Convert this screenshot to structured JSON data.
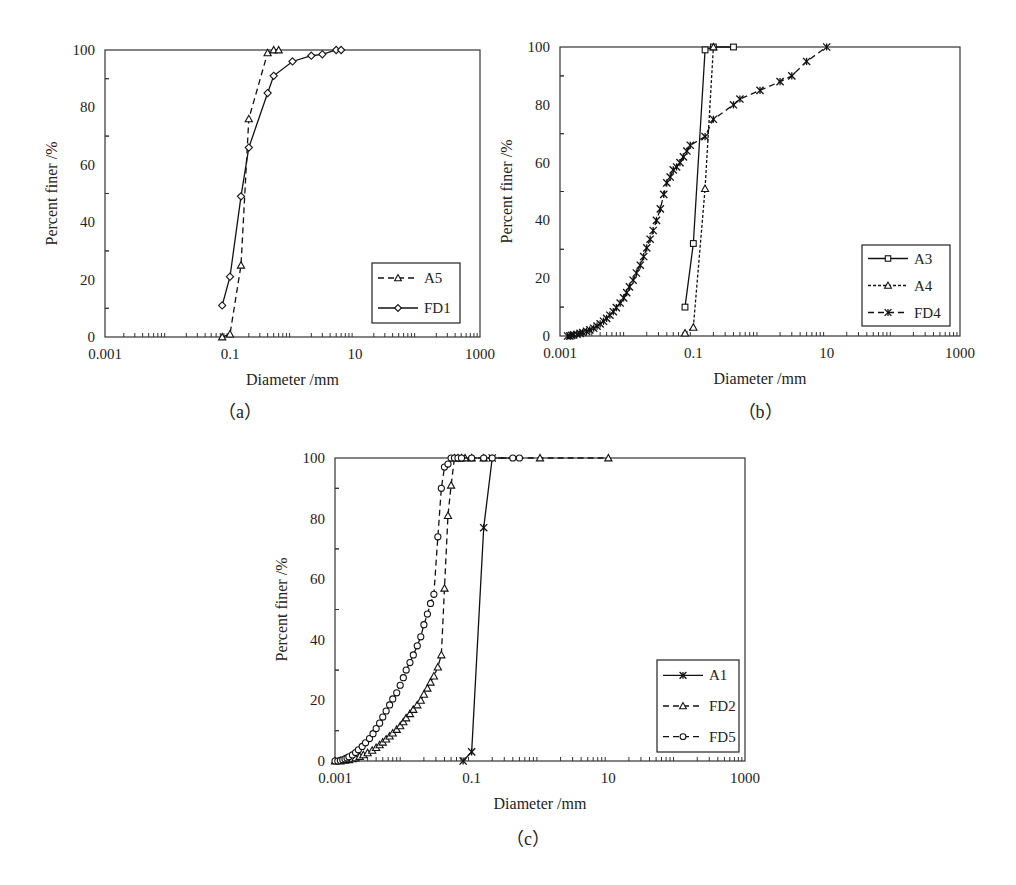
{
  "figure": {
    "panels": [
      "a",
      "b",
      "c"
    ]
  },
  "chart_data": [
    {
      "id": "a",
      "type": "line",
      "caption": "（a）",
      "xlabel": "Diameter /mm",
      "ylabel": "Percent finer /%",
      "xscale": "log",
      "xlim": [
        0.001,
        1000
      ],
      "ylim": [
        0,
        100
      ],
      "xticks": [
        "0.001",
        "0.1",
        "10",
        "1000"
      ],
      "yticks": [
        "0",
        "20",
        "40",
        "60",
        "80",
        "100"
      ],
      "legend_position": "lower right",
      "frame": {
        "left": 105,
        "top": 50,
        "right": 480,
        "bottom": 337
      },
      "legend_box": {
        "x": 372,
        "y": 263,
        "w": 88,
        "h": 60
      },
      "caption_pos": {
        "x": 240,
        "y": 418
      },
      "series": [
        {
          "name": "A5",
          "marker": "triangle",
          "line": "dashed",
          "x": [
            0.075,
            0.1,
            0.15,
            0.2,
            0.4,
            0.5,
            0.6
          ],
          "y": [
            0,
            1,
            25,
            76,
            99,
            100,
            100
          ]
        },
        {
          "name": "FD1",
          "marker": "diamond",
          "line": "solid",
          "x": [
            0.075,
            0.1,
            0.15,
            0.2,
            0.4,
            0.5,
            1,
            2,
            3,
            5,
            6
          ],
          "y": [
            11,
            21,
            49,
            66,
            85,
            91,
            96,
            98,
            98.5,
            100,
            100
          ]
        }
      ]
    },
    {
      "id": "b",
      "type": "line",
      "caption": "（b）",
      "xlabel": "Diameter  /mm",
      "ylabel": "Percent finer /%",
      "xscale": "log",
      "xlim": [
        0.001,
        1000
      ],
      "ylim": [
        0,
        100
      ],
      "xticks": [
        "0.001",
        "0.1",
        "10",
        "1000"
      ],
      "yticks": [
        "0",
        "20",
        "40",
        "60",
        "80",
        "100"
      ],
      "legend_position": "lower right",
      "frame": {
        "left": 560,
        "top": 47,
        "right": 960,
        "bottom": 336
      },
      "legend_box": {
        "x": 862,
        "y": 245,
        "w": 88,
        "h": 81
      },
      "caption_pos": {
        "x": 760,
        "y": 418
      },
      "series": [
        {
          "name": "A3",
          "marker": "square",
          "line": "solid",
          "x": [
            0.075,
            0.1,
            0.15,
            0.2,
            0.4
          ],
          "y": [
            10,
            32,
            99,
            100,
            100
          ]
        },
        {
          "name": "A4",
          "marker": "triangle",
          "line": "dotted",
          "x": [
            0.075,
            0.1,
            0.15,
            0.2
          ],
          "y": [
            1,
            3,
            51,
            100
          ]
        },
        {
          "name": "FD4",
          "marker": "asterisk",
          "line": "dashed",
          "x": [
            0.0013,
            0.0014,
            0.0015,
            0.0016,
            0.0018,
            0.002,
            0.0022,
            0.0025,
            0.0028,
            0.0032,
            0.0036,
            0.004,
            0.0045,
            0.005,
            0.0056,
            0.0063,
            0.007,
            0.008,
            0.009,
            0.01,
            0.011,
            0.0125,
            0.014,
            0.016,
            0.018,
            0.02,
            0.0225,
            0.025,
            0.028,
            0.032,
            0.036,
            0.04,
            0.045,
            0.05,
            0.056,
            0.063,
            0.071,
            0.08,
            0.09,
            0.15,
            0.2,
            0.4,
            0.5,
            1,
            2,
            3,
            5,
            10
          ],
          "y": [
            0,
            0,
            0.2,
            0.4,
            0.6,
            0.9,
            1.2,
            1.6,
            2.1,
            2.7,
            3.4,
            4.2,
            5.1,
            6.1,
            7.2,
            8.4,
            9.8,
            11.4,
            13.2,
            15,
            17,
            19.3,
            21.8,
            24.5,
            27.5,
            30.5,
            33.5,
            36.5,
            40,
            44,
            49,
            53,
            55,
            57.5,
            58.5,
            60,
            62,
            64,
            66,
            69,
            75,
            80,
            82,
            85,
            88,
            90,
            95,
            100
          ]
        }
      ]
    },
    {
      "id": "c",
      "type": "line",
      "caption": "（c）",
      "xlabel": "Diameter /mm",
      "ylabel": "Percent finer /%",
      "xscale": "log",
      "xlim": [
        0.001,
        1000
      ],
      "ylim": [
        0,
        100
      ],
      "xticks": [
        "0.001",
        "0.1",
        "10",
        "1000"
      ],
      "yticks": [
        "0",
        "20",
        "40",
        "60",
        "80",
        "100"
      ],
      "legend_position": "lower right",
      "frame": {
        "left": 335,
        "top": 458,
        "right": 745,
        "bottom": 761
      },
      "legend_box": {
        "x": 657,
        "y": 660,
        "w": 82,
        "h": 92
      },
      "caption_pos": {
        "x": 528,
        "y": 845
      },
      "series": [
        {
          "name": "A1",
          "marker": "asterisk",
          "line": "solid",
          "x": [
            0.075,
            0.1,
            0.15,
            0.2
          ],
          "y": [
            0,
            3,
            77,
            100
          ]
        },
        {
          "name": "FD2",
          "marker": "triangle",
          "line": "dashed",
          "x": [
            0.001,
            0.0012,
            0.0014,
            0.0016,
            0.0018,
            0.002,
            0.0023,
            0.0026,
            0.003,
            0.0035,
            0.004,
            0.0045,
            0.005,
            0.0056,
            0.0063,
            0.007,
            0.008,
            0.009,
            0.01,
            0.011,
            0.0125,
            0.014,
            0.016,
            0.018,
            0.02,
            0.0225,
            0.025,
            0.028,
            0.032,
            0.036,
            0.04,
            0.045,
            0.05,
            0.056,
            0.063,
            0.071,
            0.08,
            0.1,
            0.15,
            1,
            10
          ],
          "y": [
            0,
            0,
            0.2,
            0.4,
            0.7,
            1,
            1.5,
            2,
            2.7,
            3.5,
            4.4,
            5.3,
            6.2,
            7.2,
            8.2,
            9.2,
            10.4,
            11.6,
            12.9,
            14.2,
            15.6,
            17,
            18.5,
            20,
            22,
            24,
            26,
            28,
            31,
            35,
            57,
            81,
            91,
            100,
            100,
            100,
            100,
            100,
            100,
            100,
            100
          ]
        },
        {
          "name": "FD5",
          "marker": "circle",
          "line": "dashed",
          "x": [
            0.001,
            0.0011,
            0.0012,
            0.0013,
            0.0014,
            0.0015,
            0.0016,
            0.0018,
            0.002,
            0.0022,
            0.0025,
            0.0028,
            0.0032,
            0.0036,
            0.004,
            0.0045,
            0.005,
            0.0056,
            0.0063,
            0.007,
            0.008,
            0.009,
            0.01,
            0.011,
            0.0125,
            0.014,
            0.016,
            0.018,
            0.02,
            0.0225,
            0.025,
            0.028,
            0.032,
            0.036,
            0.04,
            0.045,
            0.05,
            0.056,
            0.063,
            0.071,
            0.1,
            0.15,
            0.2,
            0.4,
            0.5
          ],
          "y": [
            0,
            0,
            0.2,
            0.4,
            0.7,
            1,
            1.4,
            2,
            2.8,
            3.7,
            4.8,
            6,
            7.4,
            9,
            10.7,
            12.5,
            14.5,
            16.5,
            18.5,
            20.5,
            22.5,
            25,
            27.5,
            30,
            32.5,
            35,
            38,
            41,
            45,
            48.5,
            52,
            55,
            74,
            90,
            97,
            98,
            100,
            100,
            100,
            100,
            100,
            100,
            100,
            100,
            100
          ]
        }
      ]
    }
  ]
}
